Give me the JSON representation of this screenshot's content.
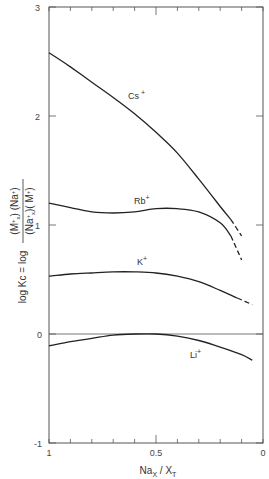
{
  "chart_data": {
    "type": "line",
    "title": "",
    "xlabel": "Na_X / X_T",
    "ylabel": "log K_c = log ((M+_x)(Na+)) / ((Na+_x)(M+))",
    "xlim": [
      1,
      0
    ],
    "ylim": [
      -1,
      3
    ],
    "x_reversed": true,
    "grid": false,
    "legend_position": "inline labels",
    "x_ticks": [
      1,
      0.9,
      0.8,
      0.7,
      0.6,
      0.5,
      0.4,
      0.3,
      0.2,
      0.1,
      0
    ],
    "x_tick_labels": [
      {
        "value": 1,
        "label": "1"
      },
      {
        "value": 0.5,
        "label": "0.5"
      },
      {
        "value": 0,
        "label": "0"
      }
    ],
    "y_ticks": [
      -1,
      0,
      1,
      2,
      3
    ],
    "y_tick_labels": [
      "-1",
      "0",
      "1",
      "2",
      "3"
    ],
    "reference_line": {
      "y": 0
    },
    "series": [
      {
        "name": "Cs+",
        "label_pos": {
          "x": 0.55,
          "y": 2.15
        },
        "solid": [
          [
            1.0,
            2.58
          ],
          [
            0.9,
            2.45
          ],
          [
            0.8,
            2.31
          ],
          [
            0.7,
            2.17
          ],
          [
            0.6,
            2.02
          ],
          [
            0.5,
            1.85
          ],
          [
            0.4,
            1.66
          ],
          [
            0.3,
            1.42
          ],
          [
            0.2,
            1.17
          ],
          [
            0.15,
            1.05
          ]
        ],
        "dashed": [
          [
            0.15,
            1.05
          ],
          [
            0.1,
            0.9
          ]
        ]
      },
      {
        "name": "Rb+",
        "label_pos": {
          "x": 0.55,
          "y": 1.28
        },
        "solid": [
          [
            1.0,
            1.2
          ],
          [
            0.9,
            1.16
          ],
          [
            0.8,
            1.12
          ],
          [
            0.7,
            1.11
          ],
          [
            0.6,
            1.12
          ],
          [
            0.5,
            1.15
          ],
          [
            0.4,
            1.15
          ],
          [
            0.3,
            1.12
          ],
          [
            0.2,
            1.02
          ],
          [
            0.15,
            0.9
          ]
        ],
        "dashed": [
          [
            0.15,
            0.9
          ],
          [
            0.1,
            0.68
          ]
        ]
      },
      {
        "name": "K+",
        "label_pos": {
          "x": 0.58,
          "y": 0.67
        },
        "solid": [
          [
            1.0,
            0.53
          ],
          [
            0.9,
            0.55
          ],
          [
            0.8,
            0.56
          ],
          [
            0.7,
            0.57
          ],
          [
            0.6,
            0.57
          ],
          [
            0.5,
            0.56
          ],
          [
            0.4,
            0.53
          ],
          [
            0.3,
            0.48
          ],
          [
            0.2,
            0.4
          ],
          [
            0.12,
            0.33
          ]
        ],
        "dashed": [
          [
            0.12,
            0.33
          ],
          [
            0.05,
            0.27
          ]
        ]
      },
      {
        "name": "Li+",
        "label_pos": {
          "x": 0.25,
          "y": -0.2
        },
        "solid": [
          [
            1.0,
            -0.11
          ],
          [
            0.9,
            -0.07
          ],
          [
            0.8,
            -0.04
          ],
          [
            0.7,
            -0.01
          ],
          [
            0.6,
            0.0
          ],
          [
            0.5,
            0.0
          ],
          [
            0.4,
            -0.02
          ],
          [
            0.3,
            -0.06
          ],
          [
            0.2,
            -0.12
          ],
          [
            0.1,
            -0.19
          ],
          [
            0.05,
            -0.24
          ]
        ],
        "dashed": []
      }
    ]
  },
  "labels": {
    "series": [
      "Cs+",
      "Rb+",
      "K+",
      "Li+"
    ],
    "x_axis": "Nax / XT",
    "y_axis_left": "log Kc = log",
    "y_axis_fraction_num": "(M+x) (Na+)",
    "y_axis_fraction_den": "(Na+x)(M+)",
    "x_tick_1": "1",
    "x_tick_05": "0.5",
    "x_tick_0": "0",
    "y_tick_m1": "-1",
    "y_tick_0": "0",
    "y_tick_1": "1",
    "y_tick_2": "2",
    "y_tick_3": "3"
  },
  "colors": {
    "line": "#222222",
    "axis": "#444444",
    "background": "#ffffff"
  }
}
